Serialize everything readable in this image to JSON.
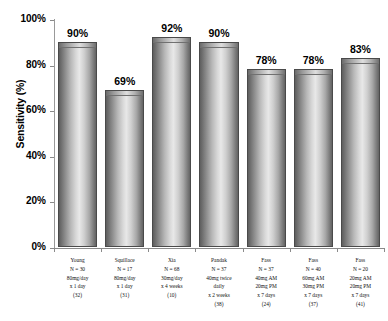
{
  "chart_data": {
    "type": "bar",
    "title": "",
    "xlabel": "",
    "ylabel": "Sensitivity (%)",
    "ylim": [
      0,
      100
    ],
    "grid": false,
    "legend": "none",
    "ytick_labels": [
      "100%",
      "80%",
      "60%",
      "40%",
      "20%",
      "0%"
    ],
    "ytick_values": [
      100,
      80,
      60,
      40,
      20,
      0
    ],
    "categories": [
      "Young",
      "Squillace",
      "Xia",
      "Pandak",
      "Fass",
      "Fass",
      "Fass"
    ],
    "values": [
      90,
      69,
      92,
      90,
      78,
      78,
      83
    ],
    "data_labels": [
      "90%",
      "69%",
      "92%",
      "90%",
      "78%",
      "78%",
      "83%"
    ],
    "bars": [
      {
        "name": "Young",
        "value": 90,
        "label": "90%",
        "lines": [
          "Young",
          "N = 30",
          "80mg/day",
          "x 1 day",
          "(32)"
        ]
      },
      {
        "name": "Squillace",
        "value": 69,
        "label": "69%",
        "lines": [
          "Squillace",
          "N = 17",
          "80mg/day",
          "x 1 day",
          "(31)"
        ]
      },
      {
        "name": "Xia",
        "value": 92,
        "label": "92%",
        "lines": [
          "Xia",
          "N = 68",
          "30mg/day",
          "x 4 weeks",
          "(10)"
        ]
      },
      {
        "name": "Pandak",
        "value": 90,
        "label": "90%",
        "lines": [
          "Pandak",
          "N = 37",
          "40mg twice",
          "daily",
          "x 2 weeks",
          "(38)"
        ]
      },
      {
        "name": "Fass-40-20",
        "value": 78,
        "label": "78%",
        "lines": [
          "Fass",
          "N = 37",
          "40mg AM",
          "20mg PM",
          "x 7 days",
          "(24)"
        ]
      },
      {
        "name": "Fass-60-30",
        "value": 78,
        "label": "78%",
        "lines": [
          "Fass",
          "N = 40",
          "60mg AM",
          "30mg PM",
          "x 7 days",
          "(37)"
        ]
      },
      {
        "name": "Fass-20-20",
        "value": 83,
        "label": "83%",
        "lines": [
          "Fass",
          "N = 20",
          "20mg AM",
          "20mg PM",
          "x 7 days",
          "(41)"
        ]
      }
    ],
    "colors": {
      "bar_light": "#e8e8e8",
      "bar_dark": "#5e5e5e",
      "axis": "#8a8a8a",
      "text": "#000000"
    }
  }
}
